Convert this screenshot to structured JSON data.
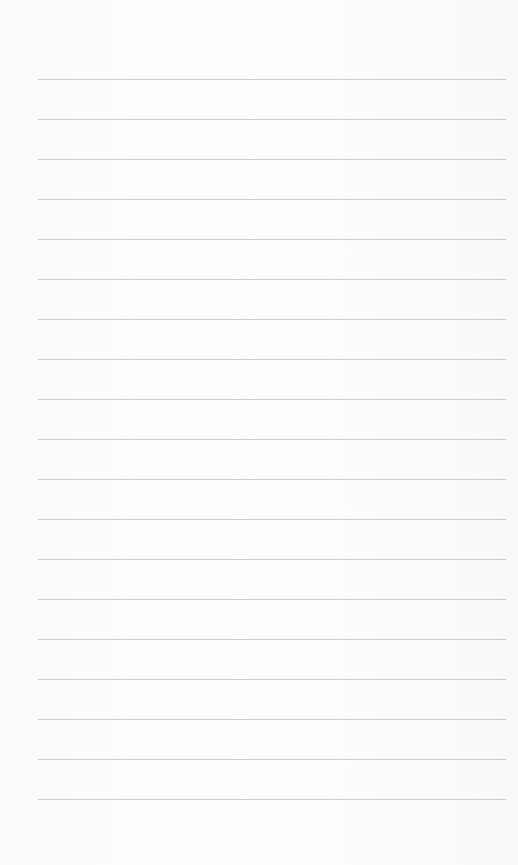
{
  "paper": {
    "type": "lined-paper",
    "line_count": 19,
    "first_line_y": 79,
    "line_spacing": 40,
    "line_color": "#c4c4c4",
    "background_color": "#fdfdfd"
  }
}
